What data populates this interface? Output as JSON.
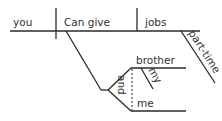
{
  "diagram": {
    "type": "sentence-diagram",
    "subject": "you",
    "verb": "Can give",
    "direct_object": "jobs",
    "object_modifier": "part-time",
    "indirect_objects": [
      "brother",
      "me"
    ],
    "indirect_object_modifier": "my",
    "conjunction": "and",
    "colors": {
      "line": "#2a2a2a",
      "text": "#333333",
      "background": "#ffffff"
    }
  }
}
